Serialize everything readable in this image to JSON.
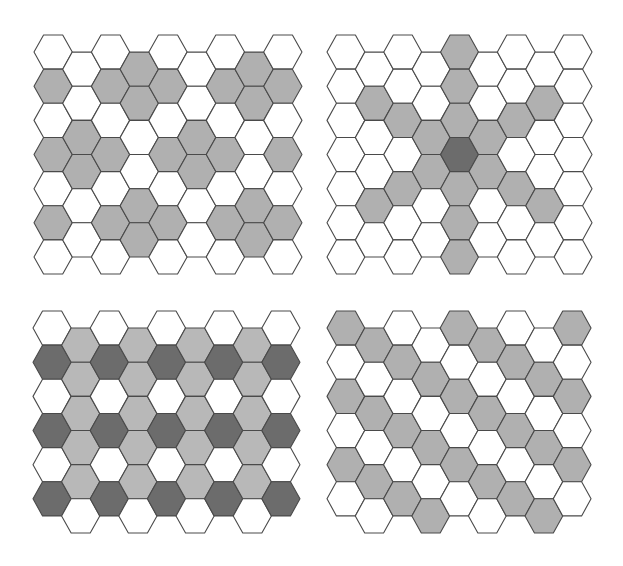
{
  "colors": {
    "white": "#ffffff",
    "gray": "#b0b0b0",
    "light": "#b8b8b8",
    "dark": "#6c6c6c",
    "stroke": "#4a4a4a"
  },
  "grids": [
    {
      "name": "grid-top-left",
      "origin": [
        34,
        35
      ],
      "side": 19.14,
      "hex_height": 34.15,
      "columns": 9,
      "even_rows": 7,
      "odd_rows": 6,
      "fill": {
        "0": {
          "1": "gray",
          "3": "gray",
          "5": "gray"
        },
        "1": {
          "2": "gray",
          "3": "gray"
        },
        "2": {
          "1": "gray",
          "3": "gray",
          "5": "gray"
        },
        "3": {
          "0": "gray",
          "1": "gray",
          "4": "gray",
          "5": "gray"
        },
        "4": {
          "1": "gray",
          "3": "gray",
          "5": "gray"
        },
        "5": {
          "2": "gray",
          "3": "gray"
        },
        "6": {
          "1": "gray",
          "3": "gray",
          "5": "gray"
        },
        "7": {
          "0": "gray",
          "1": "gray",
          "4": "gray",
          "5": "gray"
        },
        "8": {
          "1": "gray",
          "3": "gray",
          "5": "gray"
        }
      }
    },
    {
      "name": "grid-top-right",
      "origin": [
        327,
        35
      ],
      "side": 18.93,
      "hex_height": 34.15,
      "columns": 9,
      "even_rows": 7,
      "odd_rows": 6,
      "fill": {
        "1": {
          "1": "gray",
          "4": "gray"
        },
        "2": {
          "2": "gray",
          "4": "gray"
        },
        "3": {
          "2": "gray",
          "3": "gray"
        },
        "4": {
          "0": "gray",
          "1": "gray",
          "2": "gray",
          "3": "dark",
          "4": "gray",
          "5": "gray",
          "6": "gray"
        },
        "5": {
          "2": "gray",
          "3": "gray"
        },
        "6": {
          "2": "gray",
          "4": "gray"
        },
        "7": {
          "1": "gray",
          "4": "gray"
        }
      }
    },
    {
      "name": "grid-bottom-left",
      "origin": [
        33,
        311
      ],
      "side": 19.07,
      "hex_height": 34.15,
      "columns": 9,
      "even_rows": 6,
      "odd_rows": 6,
      "fill": {
        "0": {
          "1": "dark",
          "3": "dark",
          "5": "dark"
        },
        "1": {
          "0": "light",
          "1": "light",
          "2": "light",
          "3": "light",
          "4": "light"
        },
        "2": {
          "1": "dark",
          "3": "dark",
          "5": "dark"
        },
        "3": {
          "0": "light",
          "1": "light",
          "2": "light",
          "3": "light",
          "4": "light"
        },
        "4": {
          "1": "dark",
          "3": "dark",
          "5": "dark"
        },
        "5": {
          "0": "light",
          "1": "light",
          "2": "light",
          "3": "light",
          "4": "light"
        },
        "6": {
          "1": "dark",
          "3": "dark",
          "5": "dark"
        },
        "7": {
          "0": "light",
          "1": "light",
          "2": "light",
          "3": "light",
          "4": "light"
        },
        "8": {
          "1": "dark",
          "3": "dark",
          "5": "dark"
        }
      }
    },
    {
      "name": "grid-bottom-right",
      "origin": [
        327,
        311
      ],
      "side": 18.86,
      "hex_height": 34.15,
      "columns": 9,
      "even_rows": 6,
      "odd_rows": 6,
      "fill": {
        "0": {
          "0": "gray",
          "2": "gray",
          "4": "gray"
        },
        "1": {
          "0": "gray",
          "2": "gray",
          "4": "gray"
        },
        "2": {
          "1": "gray",
          "3": "gray",
          "5": "gray"
        },
        "3": {
          "1": "gray",
          "3": "gray",
          "5": "gray"
        },
        "4": {
          "0": "gray",
          "2": "gray",
          "4": "gray"
        },
        "5": {
          "0": "gray",
          "2": "gray",
          "4": "gray"
        },
        "6": {
          "1": "gray",
          "3": "gray",
          "5": "gray"
        },
        "7": {
          "1": "gray",
          "3": "gray",
          "5": "gray"
        },
        "8": {
          "0": "gray",
          "2": "gray",
          "4": "gray"
        }
      }
    }
  ]
}
